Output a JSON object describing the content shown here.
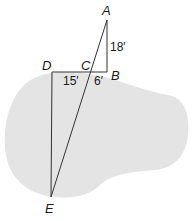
{
  "diagram": {
    "type": "similar-triangles-lake-measurement",
    "colors": {
      "lake_fill": "#e4e4e4",
      "line": "#333333",
      "text": "#1a1a1a"
    },
    "points": {
      "A": {
        "label": "A",
        "x": 107,
        "y": 20
      },
      "B": {
        "label": "B",
        "x": 107,
        "y": 72
      },
      "C": {
        "label": "C",
        "x": 89,
        "y": 72
      },
      "D": {
        "label": "D",
        "x": 52,
        "y": 72
      },
      "E": {
        "label": "E",
        "x": 51,
        "y": 197
      }
    },
    "measurements": {
      "AB": "18′",
      "DC": "15′",
      "CB": "6′"
    }
  }
}
